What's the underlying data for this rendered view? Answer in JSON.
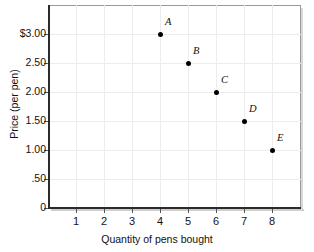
{
  "chart_data": {
    "type": "scatter",
    "title": "",
    "xlabel": "Quantity of pens bought",
    "ylabel": "Price (per pen)",
    "xlim": [
      0,
      9
    ],
    "ylim": [
      0,
      3.5
    ],
    "grid": true,
    "legend": "none",
    "x_ticks": [
      "1",
      "2",
      "3",
      "4",
      "5",
      "6",
      "7",
      "8"
    ],
    "x_tick_values": [
      1,
      2,
      3,
      4,
      5,
      6,
      7,
      8
    ],
    "y_ticks": [
      "0",
      ".50",
      "1.00",
      "1.50",
      "2.00",
      "2.50",
      "$3.00"
    ],
    "y_tick_values": [
      0,
      0.5,
      1.0,
      1.5,
      2.0,
      2.5,
      3.0
    ],
    "point_labels": [
      "A",
      "B",
      "C",
      "D",
      "E"
    ],
    "x": [
      4,
      5,
      6,
      7,
      8
    ],
    "values": [
      3.0,
      2.5,
      2.0,
      1.5,
      1.0
    ],
    "points": [
      {
        "label": "A",
        "x": 4,
        "y": 3.0
      },
      {
        "label": "B",
        "x": 5,
        "y": 2.5
      },
      {
        "label": "C",
        "x": 6,
        "y": 2.0
      },
      {
        "label": "D",
        "x": 7,
        "y": 1.5
      },
      {
        "label": "E",
        "x": 8,
        "y": 1.0
      }
    ],
    "marker_color": "#000000",
    "grid_color": "#ececec",
    "axis_color": "#2b2b2b"
  }
}
